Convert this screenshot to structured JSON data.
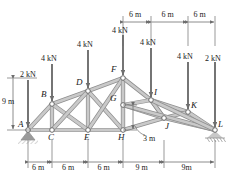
{
  "figure": {
    "type": "truss-free-body-diagram",
    "colors": {
      "member_fill": "#c9c9c9",
      "member_stroke": "#8f8f8f",
      "arrow": "#6e6e6e",
      "dim_line": "#6e6e6e",
      "text": "#1a1a1a",
      "support": "#9a9a9a",
      "background": "#ffffff"
    },
    "joints": [
      {
        "id": "A",
        "label": "A",
        "x": 28,
        "y": 130,
        "label_dx": -10,
        "label_dy": -11
      },
      {
        "id": "B",
        "label": "B",
        "x": 52,
        "y": 104,
        "label_dx": -11,
        "label_dy": -15
      },
      {
        "id": "C",
        "label": "C",
        "x": 52,
        "y": 130,
        "label_dx": -4,
        "label_dy": 2
      },
      {
        "id": "D",
        "label": "D",
        "x": 88,
        "y": 91,
        "label_dx": -12,
        "label_dy": -14
      },
      {
        "id": "E",
        "label": "E",
        "x": 88,
        "y": 130,
        "label_dx": -4,
        "label_dy": 2
      },
      {
        "id": "F",
        "label": "F",
        "x": 123,
        "y": 78,
        "label_dx": -12,
        "label_dy": -14
      },
      {
        "id": "G",
        "label": "G",
        "x": 123,
        "y": 105,
        "label_dx": -13,
        "label_dy": -12
      },
      {
        "id": "H",
        "label": "H",
        "x": 123,
        "y": 130,
        "label_dx": -5,
        "label_dy": 2
      },
      {
        "id": "I",
        "label": "I",
        "x": 151,
        "y": 100,
        "label_dx": 3,
        "label_dy": -13
      },
      {
        "id": "J",
        "label": "J",
        "x": 164,
        "y": 118,
        "label_dx": 1,
        "label_dy": 3
      },
      {
        "id": "K",
        "label": "K",
        "x": 188,
        "y": 112,
        "label_dx": 3,
        "label_dy": -12
      },
      {
        "id": "L",
        "label": "L",
        "x": 215,
        "y": 130,
        "label_dx": 3,
        "label_dy": -11
      }
    ],
    "members": [
      [
        "A",
        "B"
      ],
      [
        "B",
        "D"
      ],
      [
        "D",
        "F"
      ],
      [
        "A",
        "C"
      ],
      [
        "C",
        "E"
      ],
      [
        "E",
        "H"
      ],
      [
        "H",
        "J"
      ],
      [
        "J",
        "L"
      ],
      [
        "B",
        "C"
      ],
      [
        "D",
        "E"
      ],
      [
        "F",
        "H"
      ],
      [
        "B",
        "E"
      ],
      [
        "C",
        "D"
      ],
      [
        "D",
        "H"
      ],
      [
        "E",
        "F"
      ],
      [
        "F",
        "G"
      ],
      [
        "G",
        "H"
      ],
      [
        "F",
        "I"
      ],
      [
        "G",
        "I"
      ],
      [
        "G",
        "J"
      ],
      [
        "I",
        "J"
      ],
      [
        "I",
        "K"
      ],
      [
        "J",
        "K"
      ],
      [
        "K",
        "L"
      ],
      [
        "J",
        "I"
      ],
      [
        "G",
        "L"
      ],
      [
        "I",
        "L"
      ]
    ],
    "loads": [
      {
        "id": "load-A",
        "label": "2 kN",
        "x": 28,
        "arrow_top": 80,
        "arrow_bottom": 127,
        "label_x": 20,
        "label_y": 70
      },
      {
        "id": "load-B",
        "label": "4 kN",
        "x": 52,
        "arrow_top": 64,
        "arrow_bottom": 101,
        "label_x": 41,
        "label_y": 54
      },
      {
        "id": "load-D",
        "label": "4 kN",
        "x": 88,
        "arrow_top": 50,
        "arrow_bottom": 88,
        "label_x": 77,
        "label_y": 40
      },
      {
        "id": "load-F",
        "label": "4 kN",
        "x": 123,
        "arrow_top": 35,
        "arrow_bottom": 75,
        "label_x": 112,
        "label_y": 26
      },
      {
        "id": "load-I",
        "label": "4 kN",
        "x": 151,
        "arrow_top": 48,
        "arrow_bottom": 97,
        "label_x": 140,
        "label_y": 38
      },
      {
        "id": "load-K",
        "label": "4 kN",
        "x": 188,
        "arrow_top": 62,
        "arrow_bottom": 109,
        "label_x": 177,
        "label_y": 52
      },
      {
        "id": "load-L",
        "label": "2 kN",
        "x": 215,
        "arrow_top": 62,
        "arrow_bottom": 127,
        "label_x": 205,
        "label_y": 54
      }
    ],
    "dimensions": {
      "top": {
        "y": 22,
        "ticks": [
          123,
          151,
          188,
          215
        ],
        "segments": [
          {
            "label": "6 m",
            "x1": 123,
            "x2": 151
          },
          {
            "label": "6 m",
            "x1": 151,
            "x2": 188
          },
          {
            "label": "6 m",
            "x1": 188,
            "x2": 215
          }
        ]
      },
      "bottom": {
        "y": 162,
        "ticks": [
          28,
          52,
          88,
          123,
          164,
          215
        ],
        "segments": [
          {
            "label": "6 m",
            "x1": 28,
            "x2": 52
          },
          {
            "label": "6 m",
            "x1": 52,
            "x2": 88
          },
          {
            "label": "6 m",
            "x1": 88,
            "x2": 123
          },
          {
            "label": "9 m",
            "x1": 123,
            "x2": 164
          },
          {
            "label": "9m",
            "x1": 164,
            "x2": 215
          }
        ]
      },
      "left": {
        "x": 13,
        "label": "9 m",
        "y1": 78,
        "y2": 130,
        "label_x": 2,
        "label_y": 97
      },
      "inner": {
        "label": "3 m",
        "label_x": 143,
        "label_y": 134,
        "y1": 105,
        "y2": 130,
        "x": 133
      }
    },
    "supports": [
      {
        "id": "pin-support-A",
        "type": "pin",
        "x": 28,
        "y": 130
      },
      {
        "id": "roller-support-L",
        "type": "roller",
        "x": 215,
        "y": 130
      }
    ]
  }
}
